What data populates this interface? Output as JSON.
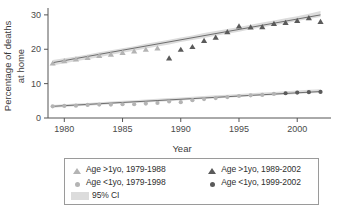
{
  "chart_data": {
    "type": "scatter",
    "title": "",
    "xlabel": "Year",
    "ylabel": "Percentage of deaths at home",
    "ylabel_line1": "Percentage of deaths",
    "ylabel_line2": "at home",
    "xlim": [
      1978.6,
      2002.9
    ],
    "ylim": [
      0,
      32
    ],
    "xticks": [
      1980,
      1985,
      1990,
      1995,
      2000
    ],
    "yticks": [
      0,
      10,
      20,
      30
    ],
    "grid": false,
    "legend_position": "below-plot",
    "series": [
      {
        "name": "Age >1yo, 1979-1988",
        "marker": "triangle",
        "color": "#b4b4b4",
        "x": [
          1979,
          1980,
          1981,
          1982,
          1983,
          1984,
          1985,
          1986,
          1987,
          1988
        ],
        "values": [
          16.0,
          16.7,
          17.2,
          17.6,
          18.2,
          18.6,
          19.1,
          19.5,
          20.0,
          20.4
        ]
      },
      {
        "name": "Age >1yo, 1989-2002",
        "marker": "triangle",
        "color": "#5a5a5a",
        "x": [
          1989,
          1990,
          1991,
          1992,
          1993,
          1994,
          1995,
          1996,
          1997,
          1998,
          1999,
          2000,
          2001,
          2002
        ],
        "values": [
          17.5,
          20.0,
          20.8,
          22.6,
          23.5,
          25.1,
          26.8,
          26.5,
          26.6,
          27.5,
          27.8,
          28.4,
          29.2,
          28.1
        ]
      },
      {
        "name": "Age <1yo, 1979-1998",
        "marker": "circle",
        "color": "#b4b4b4",
        "x": [
          1979,
          1980,
          1981,
          1982,
          1983,
          1984,
          1985,
          1986,
          1987,
          1988,
          1989,
          1990,
          1991,
          1992,
          1993,
          1994,
          1995,
          1996,
          1997,
          1998
        ],
        "values": [
          3.4,
          3.5,
          3.6,
          3.8,
          3.9,
          3.9,
          4.0,
          4.0,
          4.2,
          4.4,
          4.8,
          4.6,
          5.2,
          5.5,
          5.8,
          6.1,
          6.4,
          6.6,
          6.7,
          7.0
        ]
      },
      {
        "name": "Age <1yo, 1999-2002",
        "marker": "circle",
        "color": "#5a5a5a",
        "x": [
          1999,
          2000,
          2001,
          2002
        ],
        "values": [
          7.2,
          7.4,
          7.5,
          7.6
        ]
      }
    ],
    "fit_lines": [
      {
        "name": "Age >1yo trend",
        "x": [
          1979,
          2002
        ],
        "y": [
          16.1,
          30.0
        ]
      },
      {
        "name": "Age <1yo trend",
        "x": [
          1979,
          2002
        ],
        "y": [
          3.4,
          7.7
        ]
      }
    ],
    "confidence_band": {
      "label": "95% CI",
      "color": "#dcdcdc",
      "upper_gt1": [
        16.9,
        17.4,
        17.9,
        18.5,
        19.1,
        19.7,
        20.3,
        20.9,
        21.6,
        22.2,
        22.8,
        23.4,
        24.0,
        24.7,
        25.3,
        25.9,
        26.5,
        27.1,
        27.8,
        28.4,
        29.0,
        29.6,
        30.3,
        31.1
      ],
      "lower_gt1": [
        15.3,
        15.9,
        16.5,
        17.1,
        17.7,
        18.4,
        19.0,
        19.6,
        20.2,
        20.8,
        21.4,
        22.1,
        22.7,
        23.3,
        23.9,
        24.5,
        25.1,
        25.8,
        26.4,
        27.0,
        27.6,
        28.2,
        28.8,
        29.4
      ],
      "upper_lt1": [
        3.8,
        4.0,
        4.2,
        4.4,
        4.6,
        4.8,
        5.0,
        5.2,
        5.4,
        5.6,
        5.8,
        6.0,
        6.2,
        6.4,
        6.6,
        6.8,
        7.0,
        7.2,
        7.4,
        7.6,
        7.8,
        8.0,
        8.2,
        8.4
      ],
      "lower_lt1": [
        3.0,
        3.2,
        3.4,
        3.6,
        3.8,
        4.0,
        4.2,
        4.4,
        4.5,
        4.7,
        4.9,
        5.1,
        5.3,
        5.5,
        5.7,
        5.9,
        6.1,
        6.3,
        6.5,
        6.6,
        6.8,
        7.0,
        7.2,
        7.3
      ]
    }
  },
  "axes": {
    "ylabel_line1": "Percentage of deaths",
    "ylabel_line2": "at home",
    "xlabel": "Year",
    "ytick_labels": [
      "30",
      "20",
      "10",
      "0"
    ],
    "xtick_labels": [
      "1980",
      "1985",
      "1990",
      "1995",
      "2000"
    ]
  },
  "legend": {
    "rows": [
      {
        "left": {
          "marker": "triangle-light",
          "label": "Age >1yo, 1979-1988"
        },
        "right": {
          "marker": "triangle-dark",
          "label": "Age >1yo, 1989-2002"
        }
      },
      {
        "left": {
          "marker": "circle-light",
          "label": "Age <1yo, 1979-1998"
        },
        "right": {
          "marker": "circle-dark",
          "label": "Age <1yo, 1999-2002"
        }
      }
    ],
    "ci": {
      "marker": "ci-swatch",
      "label": "95% CI"
    }
  },
  "colors": {
    "light_marker": "#b4b4b4",
    "dark_marker": "#5a5a5a",
    "fit_line": "#6e6e6e",
    "ci_band": "#dcdcdc",
    "axis": "#555555",
    "text": "#3a3a3a"
  }
}
